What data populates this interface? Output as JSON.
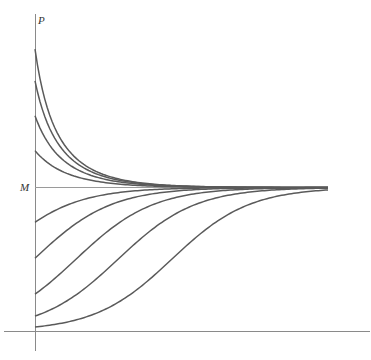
{
  "chart_data": {
    "type": "line",
    "title": "",
    "xlabel": "",
    "ylabel": "P",
    "annotations": [
      {
        "text": "M",
        "position": "y-axis",
        "meaning": "carrying capacity (horizontal line)"
      }
    ],
    "grid": false,
    "legend": null,
    "carrying_capacity": 1.0,
    "growth_rate_k": 0.76,
    "xlim": [
      0,
      10
    ],
    "ylim": [
      0,
      2.1
    ],
    "series": [
      {
        "name": "P0 = 1.97M",
        "initial_value": 1.965,
        "trend": "decreasing to M"
      },
      {
        "name": "P0 = 1.74M",
        "initial_value": 1.743,
        "trend": "decreasing to M"
      },
      {
        "name": "P0 = 1.50M",
        "initial_value": 1.5,
        "trend": "decreasing to M"
      },
      {
        "name": "P0 = 1.26M",
        "initial_value": 1.257,
        "trend": "decreasing to M"
      },
      {
        "name": "P0 = 0.76M",
        "initial_value": 0.757,
        "trend": "increasing to M"
      },
      {
        "name": "P0 = 0.51M",
        "initial_value": 0.507,
        "trend": "increasing to M"
      },
      {
        "name": "P0 = 0.26M",
        "initial_value": 0.257,
        "trend": "increasing to M"
      },
      {
        "name": "P0 = 0.10M",
        "initial_value": 0.104,
        "trend": "increasing to M"
      },
      {
        "name": "P0 = 0.03M",
        "initial_value": 0.028,
        "trend": "increasing to M"
      }
    ]
  },
  "labels": {
    "y_axis": "P",
    "m_line": "M"
  },
  "style": {
    "curve_color": "#5a5a5a",
    "axis_color": "#8a8a8a",
    "m_line_color": "#9a9a9a",
    "background": "#ffffff"
  }
}
